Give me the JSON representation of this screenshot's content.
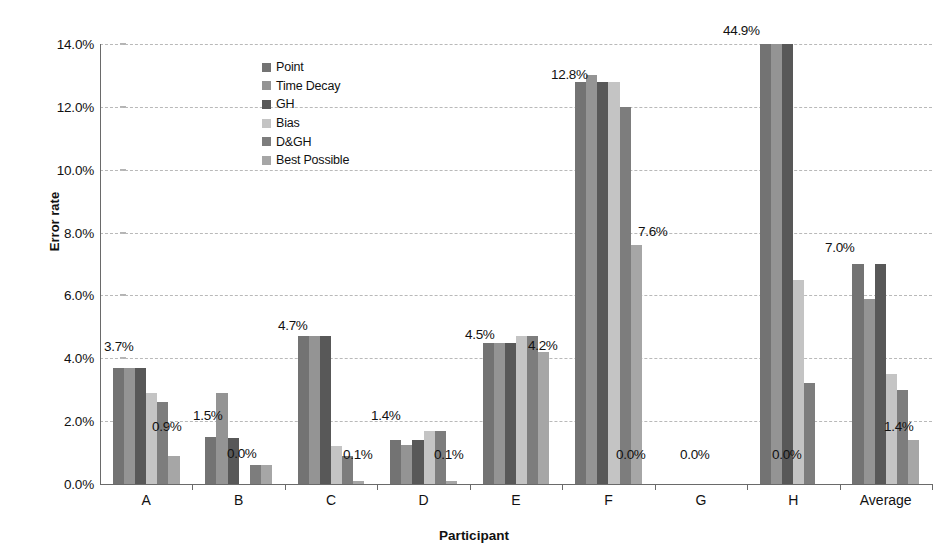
{
  "chart_data": {
    "type": "bar",
    "title": "",
    "xlabel": "Participant",
    "ylabel": "Error rate",
    "ylim": [
      0,
      14
    ],
    "ytick_step": 2,
    "ytick_labels": [
      "0.0%",
      "2.0%",
      "4.0%",
      "6.0%",
      "8.0%",
      "10.0%",
      "12.0%",
      "14.0%"
    ],
    "grid": true,
    "legend_position": "inside-top-left",
    "categories": [
      "A",
      "B",
      "C",
      "D",
      "E",
      "F",
      "G",
      "H",
      "Average"
    ],
    "series": [
      {
        "name": "Point",
        "color": "#737373",
        "values": [
          3.7,
          1.5,
          4.7,
          1.4,
          4.5,
          12.8,
          0.0,
          44.9,
          7.0
        ]
      },
      {
        "name": "Time Decay",
        "color": "#949494",
        "values": [
          3.7,
          2.9,
          4.7,
          1.25,
          4.5,
          13.0,
          0.0,
          44.9,
          5.9
        ]
      },
      {
        "name": "GH",
        "color": "#585858",
        "values": [
          3.7,
          1.45,
          4.7,
          1.4,
          4.5,
          12.8,
          0.0,
          44.9,
          7.0
        ]
      },
      {
        "name": "Bias",
        "color": "#c4c4c4",
        "values": [
          2.9,
          0.0,
          1.2,
          1.7,
          4.7,
          12.8,
          0.0,
          6.5,
          3.5
        ]
      },
      {
        "name": "D&GH",
        "color": "#7d7d7d",
        "values": [
          2.6,
          0.6,
          0.9,
          1.7,
          4.7,
          12.0,
          0.0,
          3.2,
          3.0
        ]
      },
      {
        "name": "Best Possible",
        "color": "#a6a6a6",
        "values": [
          0.9,
          0.6,
          0.1,
          0.1,
          4.2,
          7.6,
          0.0,
          0.0,
          1.4
        ]
      }
    ],
    "clip_value": 14.0,
    "annotations": [
      {
        "group": "A",
        "text": "3.7%",
        "x_px": 104,
        "y_px": 339
      },
      {
        "group": "A",
        "text": "0.9%",
        "x_px": 152,
        "y_px": 419
      },
      {
        "group": "B",
        "text": "1.5%",
        "x_px": 193,
        "y_px": 408
      },
      {
        "group": "B",
        "text": "0.0%",
        "x_px": 227,
        "y_px": 446
      },
      {
        "group": "C",
        "text": "4.7%",
        "x_px": 278,
        "y_px": 318
      },
      {
        "group": "C",
        "text": "0.1%",
        "x_px": 343,
        "y_px": 447
      },
      {
        "group": "D",
        "text": "1.4%",
        "x_px": 371,
        "y_px": 408
      },
      {
        "group": "D",
        "text": "0.1%",
        "x_px": 434,
        "y_px": 447
      },
      {
        "group": "E",
        "text": "4.5%",
        "x_px": 465,
        "y_px": 327
      },
      {
        "group": "E",
        "text": "4.2%",
        "x_px": 528,
        "y_px": 338
      },
      {
        "group": "F",
        "text": "12.8%",
        "x_px": 551,
        "y_px": 67
      },
      {
        "group": "F",
        "text": "0.0%",
        "x_px": 616,
        "y_px": 447
      },
      {
        "group": "G",
        "text": "7.6%",
        "x_px": 638,
        "y_px": 224
      },
      {
        "group": "G",
        "text": "0.0%",
        "x_px": 680,
        "y_px": 447
      },
      {
        "group": "H",
        "text": "44.9%",
        "x_px": 723,
        "y_px": 23
      },
      {
        "group": "H",
        "text": "0.0%",
        "x_px": 772,
        "y_px": 447
      },
      {
        "group": "Average",
        "text": "7.0%",
        "x_px": 825,
        "y_px": 240
      },
      {
        "group": "Average",
        "text": "1.4%",
        "x_px": 884,
        "y_px": 419
      }
    ]
  },
  "legend": {
    "items": [
      {
        "label": "Point",
        "color": "#737373"
      },
      {
        "label": "Time Decay",
        "color": "#949494"
      },
      {
        "label": "GH",
        "color": "#585858"
      },
      {
        "label": "Bias",
        "color": "#c4c4c4"
      },
      {
        "label": "D&GH",
        "color": "#7d7d7d"
      },
      {
        "label": "Best Possible",
        "color": "#a6a6a6"
      }
    ]
  }
}
